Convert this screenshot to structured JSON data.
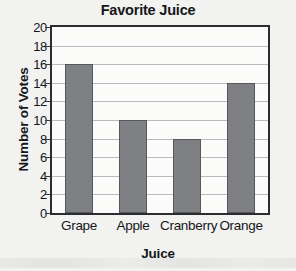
{
  "chart_data": {
    "type": "bar",
    "title": "Favorite Juice",
    "xlabel": "Juice",
    "ylabel": "Number of Votes",
    "categories": [
      "Grape",
      "Apple",
      "Cranberry",
      "Orange"
    ],
    "values": [
      16,
      10,
      8,
      14
    ],
    "ylim": [
      0,
      20
    ],
    "ytick_step": 2,
    "yticks": [
      20,
      18,
      16,
      14,
      12,
      10,
      8,
      6,
      4,
      2,
      0
    ],
    "ytick_labels": [
      "20",
      "18",
      "16",
      "14",
      "12",
      "10",
      "8",
      "6",
      "4",
      "2",
      "0"
    ],
    "grid": true,
    "grid_axis": "y",
    "legend": false,
    "bar_color": "#7f8083",
    "bar_edge_color": "#56585b",
    "axis_color": "#2b2d30",
    "grid_color": "#b9bbbd",
    "text_color": "#15171a",
    "background_color": "#f2f2f0",
    "plot_background_color": "#fbfbfa"
  }
}
